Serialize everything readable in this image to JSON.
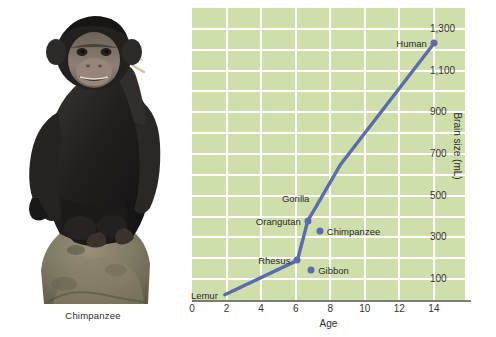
{
  "figure": {
    "photo": {
      "subject_caption": "Chimpanzee",
      "alt_name": "chimpanzee-photo"
    }
  },
  "chart_data": {
    "type": "line",
    "title": "",
    "xlabel": "Age",
    "ylabel": "Brain size (mL)",
    "xlim": [
      0,
      15.8
    ],
    "ylim": [
      0,
      1400
    ],
    "xticks": [
      0,
      2,
      4,
      6,
      8,
      10,
      12,
      14
    ],
    "xtick_labels": [
      "0",
      "2",
      "4",
      "6",
      "8",
      "10",
      "12",
      "14"
    ],
    "yticks": [
      100,
      300,
      500,
      700,
      900,
      1100,
      1300
    ],
    "ytick_labels": [
      "100",
      "300",
      "500",
      "700",
      "900",
      "1,100",
      "1,300"
    ],
    "grid": true,
    "grid_y_step": 100,
    "grid_x_step": 2,
    "legend": "none",
    "series": [
      {
        "name": "Brain size vs age",
        "x": [
          1.9,
          6.1,
          6.7,
          7.2,
          8.6,
          14.0
        ],
        "y": [
          25,
          190,
          380,
          450,
          650,
          1230
        ],
        "color": "#5b6bab"
      }
    ],
    "points": [
      {
        "label": "Lemur",
        "x": 1.9,
        "y": 25,
        "label_side": "left",
        "on_line": true,
        "dot": false
      },
      {
        "label": "Rhesus",
        "x": 6.1,
        "y": 190,
        "label_side": "left",
        "on_line": true,
        "dot": true
      },
      {
        "label": "Gibbon",
        "x": 6.9,
        "y": 145,
        "label_side": "right",
        "on_line": false,
        "dot": true
      },
      {
        "label": "Orangutan",
        "x": 6.7,
        "y": 380,
        "label_side": "left",
        "on_line": true,
        "dot": true
      },
      {
        "label": "Chimpanzee",
        "x": 7.4,
        "y": 330,
        "label_side": "right",
        "on_line": false,
        "dot": true
      },
      {
        "label": "Gorilla",
        "x": 7.2,
        "y": 490,
        "label_side": "left",
        "on_line": true,
        "dot": false
      },
      {
        "label": "Human",
        "x": 14.0,
        "y": 1230,
        "label_side": "left",
        "on_line": true,
        "dot": true
      }
    ],
    "colors": {
      "plot_background": "#cfdfac",
      "gridline": "#ffffff",
      "line": "#5b6bab",
      "axis": "#7a7f73",
      "text": "#2b2b2b"
    }
  }
}
